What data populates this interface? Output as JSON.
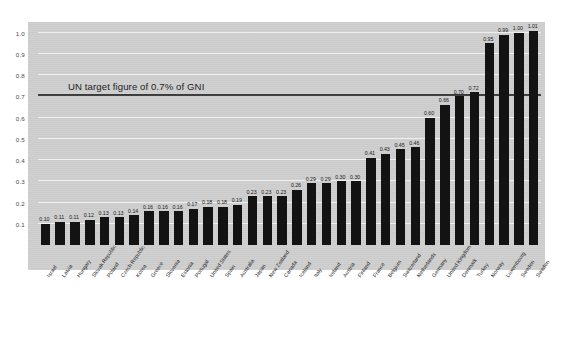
{
  "chart_data": {
    "type": "bar",
    "title": "",
    "xlabel": "",
    "ylabel": "",
    "ylim": [
      0,
      1.05
    ],
    "grid": true,
    "legend": "none",
    "annotation": "UN target figure of 0.7% of GNI",
    "annotation_value": 0.7,
    "ytick_labels": [
      "1.0",
      "0.9",
      "0.8",
      "0.7",
      "0.6",
      "0.5",
      "0.4",
      "0.3",
      "0.2",
      "0.1"
    ],
    "ytick_values": [
      1.0,
      0.9,
      0.8,
      0.7,
      0.6,
      0.5,
      0.4,
      0.3,
      0.2,
      0.1
    ],
    "categories": [
      "Israel",
      "Latvia",
      "Hungary",
      "Slovak Republic",
      "Poland",
      "Czech Republic",
      "Korea",
      "Greece",
      "Slovenia",
      "Estonia",
      "Portugal",
      "United States",
      "Spain",
      "Australia",
      "Japan",
      "New Zealand",
      "Canada",
      "Iceland",
      "Italy",
      "Ireland",
      "Austria",
      "Finland",
      "France",
      "Belgium",
      "Switzerland",
      "Netherlands",
      "Germany",
      "United Kingdom",
      "Denmark",
      "Turkey",
      "Norway",
      "Luxembourg",
      "Sweden"
    ],
    "values": [
      0.1,
      0.11,
      0.11,
      0.12,
      0.13,
      0.13,
      0.14,
      0.16,
      0.16,
      0.16,
      0.17,
      0.18,
      0.18,
      0.19,
      0.23,
      0.23,
      0.23,
      0.26,
      0.29,
      0.29,
      0.3,
      0.3,
      0.41,
      0.43,
      0.45,
      0.46,
      0.6,
      0.66,
      0.7,
      0.72,
      0.95,
      0.99,
      1.0
    ],
    "value_labels": [
      "0.10",
      "0.11",
      "0.11",
      "0.12",
      "0.13",
      "0.13",
      "0.14",
      "0.16",
      "0.16",
      "0.16",
      "0.17",
      "0.18",
      "0.18",
      "0.19",
      "0.23",
      "0.23",
      "0.23",
      "0.26",
      "0.29",
      "0.29",
      "0.30",
      "0.30",
      "0.41",
      "0.43",
      "0.45",
      "0.46",
      "0.60",
      "0.66",
      "0.70",
      "0.72",
      "0.95",
      "0.99",
      "1.00"
    ],
    "extra_last": {
      "category": "Sweden",
      "value": 1.01,
      "label": "1.01"
    },
    "colors": {
      "bar": "#131313",
      "panel": "#cfcfcf",
      "gridline": "#f2f2f2",
      "target_line": "#3a3a3a",
      "text": "#2a2a2a",
      "background": "#ffffff"
    }
  }
}
